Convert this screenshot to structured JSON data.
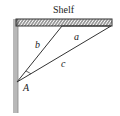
{
  "diagram": {
    "shelf_label": "Shelf",
    "side_labels": {
      "a": "a",
      "b": "b",
      "c": "c"
    },
    "vertex_label": "A",
    "colors": {
      "line": "#333333",
      "wall": "#b8b8b8",
      "wall_edge": "#888888",
      "shelf_hatch": "#333333"
    }
  }
}
